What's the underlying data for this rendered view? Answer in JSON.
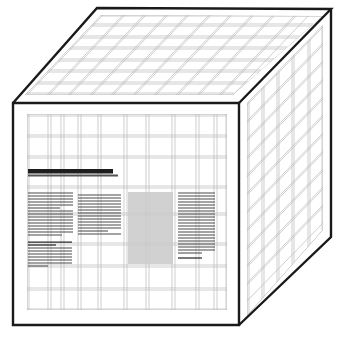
{
  "figure": {
    "type": "line-art-diagram",
    "background_color": "#ffffff",
    "edge_color": "#1a1a1a",
    "grid_color": "#b9b9b9",
    "grid_color_strong": "#8e8e8e",
    "text_stripe_color": "#4a4a4a",
    "headline_color": "#1e1e1e",
    "image_block_color": "#c9c9c9"
  },
  "cube": {
    "label": "cube-outline",
    "vertices": {
      "front_top_left": [
        13,
        103
      ],
      "front_top_right": [
        239,
        103
      ],
      "front_bottom_left": [
        13,
        325
      ],
      "front_bottom_right": [
        239,
        325
      ],
      "top_back_left": [
        97,
        8
      ],
      "top_back_right": [
        331,
        9
      ],
      "right_bottom_back": [
        331,
        237
      ]
    },
    "faces": [
      {
        "name": "front-face",
        "shape": "rectangle",
        "grid_columns": 13,
        "grid_rows": 11,
        "has_content": true
      },
      {
        "name": "top-face",
        "shape": "parallelogram",
        "grid_columns": 10,
        "grid_rows": 7,
        "has_content": false
      },
      {
        "name": "right-face",
        "shape": "parallelogram",
        "grid_columns": 6,
        "grid_rows": 13,
        "has_content": false
      }
    ]
  },
  "front_face_content": {
    "name": "document-layout",
    "headline_bar": {
      "x": 28,
      "y": 170,
      "width": 85,
      "height": 4
    },
    "headline_bar_shadow": {
      "x": 28,
      "y": 175,
      "width": 90,
      "height": 2
    },
    "image_block": {
      "x": 128,
      "y": 192,
      "width": 45,
      "height": 72
    },
    "text_blocks": [
      {
        "name": "text-block-left-upper",
        "x": 28,
        "y": 192,
        "width": 45,
        "lines": 12
      },
      {
        "name": "text-block-left-lower",
        "x": 28,
        "y": 240,
        "width": 45,
        "lines": 10
      },
      {
        "name": "text-block-center",
        "x": 78,
        "y": 192,
        "width": 45,
        "lines": 12
      },
      {
        "name": "text-block-right",
        "x": 178,
        "y": 192,
        "width": 38,
        "lines": 16
      }
    ]
  },
  "counts": {
    "visible_faces": 3,
    "text_blocks": 4,
    "image_blocks": 1,
    "headline_bars": 1
  }
}
